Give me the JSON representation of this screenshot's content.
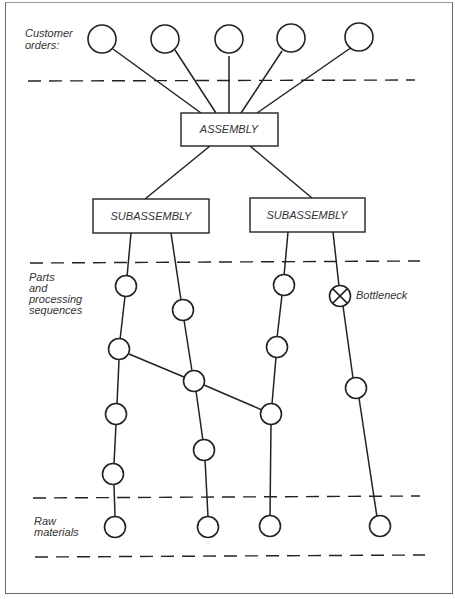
{
  "labels": {
    "customer_orders_line1": "Customer",
    "customer_orders_line2": "orders:",
    "parts_line1": "Parts",
    "parts_line2": "and",
    "parts_line3": "processing",
    "parts_line4": "sequences",
    "raw_line1": "Raw",
    "raw_line2": "materials",
    "bottleneck": "Bottleneck"
  },
  "boxes": {
    "assembly": "ASSEMBLY",
    "subassembly_left": "SUBASSEMBLY",
    "subassembly_right": "SUBASSEMBLY"
  },
  "nodes": [
    {
      "id": "co1",
      "type": "customer-order"
    },
    {
      "id": "co2",
      "type": "customer-order"
    },
    {
      "id": "co3",
      "type": "customer-order"
    },
    {
      "id": "co4",
      "type": "customer-order"
    },
    {
      "id": "co5",
      "type": "customer-order"
    },
    {
      "id": "p1",
      "type": "part"
    },
    {
      "id": "p2",
      "type": "part"
    },
    {
      "id": "p3",
      "type": "part"
    },
    {
      "id": "p4",
      "type": "part"
    },
    {
      "id": "p5",
      "type": "part"
    },
    {
      "id": "p6",
      "type": "part"
    },
    {
      "id": "p7",
      "type": "part"
    },
    {
      "id": "p8",
      "type": "part"
    },
    {
      "id": "p9",
      "type": "part"
    },
    {
      "id": "p10",
      "type": "part"
    },
    {
      "id": "p11",
      "type": "part"
    },
    {
      "id": "bn",
      "type": "bottleneck"
    },
    {
      "id": "p12",
      "type": "part"
    },
    {
      "id": "rm1",
      "type": "raw-material"
    },
    {
      "id": "rm2",
      "type": "raw-material"
    },
    {
      "id": "rm3",
      "type": "raw-material"
    },
    {
      "id": "rm4",
      "type": "raw-material"
    }
  ]
}
